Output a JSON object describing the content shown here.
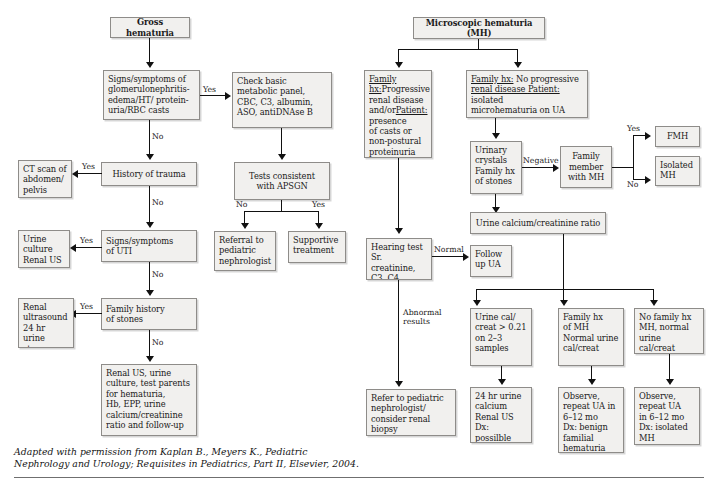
{
  "figure": {
    "caption": "Adapted with permission from Kaplan B., Meyers K., Pediatric\nNephrology and Urology; Requisites in Pediatrics, Part II, Elsevier, 2004.",
    "colors": {
      "box_fill": "#f1f0ee",
      "box_border": "#8e8c89",
      "connector": "#111111",
      "rule": "#6f6f6f",
      "text": "#1a1a1a"
    }
  },
  "left_flow": {
    "title": "Gross hematuria",
    "nodes": {
      "gn_signs": "Signs/symptoms of\nglomerulonephritis-\nedema/HT/ protein-\nuria/RBC casts",
      "check_basic": "Check basic\nmetabolic panel,\nCBC, C3, albumin,\nASO, antiDNAse B",
      "tests_apsgn": "Tests consistent\nwith APSGN",
      "referral": "Referral to\npediatric\nnephrologist",
      "supportive": "Supportive\ntreatment",
      "trauma": "History of trauma",
      "ct_scan": "CT scan of\nabdomen/\npelvis",
      "uti": "Signs/symptoms\nof UTI",
      "urine_culture": "Urine\nculture\nRenal US",
      "fh_stones": "Family history\nof stones",
      "renal_us_stone": "Renal\nultrasound\n24 hr urine\nstone profile",
      "workup": "Renal US, urine\nculture, test parents\nfor hematuria,\nHb, EPP, urine\ncalcium/creatinine\nratio and follow-up"
    },
    "edge_labels": {
      "gn_yes": "Yes",
      "gn_no": "No",
      "apsgn_no": "No",
      "apsgn_yes": "Yes",
      "trauma_yes": "Yes",
      "trauma_no": "No",
      "uti_yes": "Yes",
      "uti_no": "No",
      "stones_yes": "Yes",
      "stones_no": "No"
    }
  },
  "right_flow": {
    "title": "Microscopic hematuria (MH)",
    "nodes": {
      "family_progressive_l1": "Family hx:",
      "family_progressive_l2": "Progressive\nrenal disease\nand/or",
      "family_progressive_l3": "Patient:",
      "family_progressive_l4": " presence\nof casts or\nnon-postural\nproteinuria",
      "no_progressive_l1": "Family hx:",
      "no_progressive_l2": " No progressive\n",
      "no_progressive_l3": "renal disease ",
      "no_progressive_l4": "Patient:",
      "no_progressive_l5": " isolated\nmicrohematuria on UA",
      "urinary_crystals": "Urinary\ncrystals\nFamily hx\nof stones",
      "family_member_mh": "Family\nmember\nwith MH",
      "fmh": "FMH",
      "isolated_mh": "Isolated\nMH",
      "urine_ratio": "Urine calcium/creatinine ratio",
      "hearing_test": "Hearing test\nSr. creatinine,\nC3, C4",
      "follow_up_ua": "Follow\nup UA",
      "refer_biopsy": "Refer to pediatric\nnephrologist/\nconsider renal\nbiopsy",
      "urine_cal_high": "Urine cal/\ncreat > 0.21\non 2–3\nsamples",
      "family_hx_mh": "Family hx\nof MH\nNormal urine\ncal/creat",
      "no_family_hx": "No family hx\nMH, normal\nurine cal/creat",
      "dx_hypercalciuria": "24 hr urine\ncalcium\nRenal US\nDx: possilble\nhypercalciuria",
      "dx_benign_familial": "Observe,\nrepeat UA in\n6–12 mo\nDx: benign\nfamilial\nhematuria",
      "dx_isolated_mh": "Observe,\nrepeat UA\nin 6–12 mo\nDx: isolated\nMH"
    },
    "edge_labels": {
      "crystals_negative": "Negative",
      "member_yes": "Yes",
      "member_no": "No",
      "hearing_normal": "Normal",
      "hearing_abnormal": "Abnormal\nresults"
    }
  }
}
